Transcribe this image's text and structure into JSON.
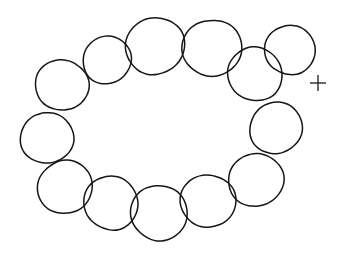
{
  "figure": {
    "background_color": "#ffffff",
    "stroke_color": "#16161a",
    "canvas": {
      "width": 346,
      "height": 272
    },
    "shape_count": 13,
    "arrangement": "closed loop / necklace",
    "stroke_width": 1.5
  },
  "chart_data": {
    "type": "scatter",
    "xlabel": "",
    "ylabel": "",
    "xlim": [
      0,
      346
    ],
    "ylim": [
      0,
      272
    ],
    "grid": false,
    "legend": "none",
    "series": [
      {
        "name": "circles",
        "marker": "open-circle",
        "points": [
          {
            "id": "circle-1",
            "label": "upper-left",
            "cx": 62,
            "cy": 85,
            "r": 26
          },
          {
            "id": "circle-2",
            "label": "left",
            "cx": 47,
            "cy": 138,
            "r": 26
          },
          {
            "id": "circle-3",
            "label": "lower-left",
            "cx": 65,
            "cy": 187,
            "r": 27
          },
          {
            "id": "circle-4",
            "label": "bottom-left",
            "cx": 111,
            "cy": 203,
            "r": 27
          },
          {
            "id": "circle-5",
            "label": "bottom-center",
            "cx": 159,
            "cy": 213,
            "r": 28
          },
          {
            "id": "circle-6",
            "label": "bottom-right",
            "cx": 208,
            "cy": 201,
            "r": 27
          },
          {
            "id": "circle-7",
            "label": "lower-right",
            "cx": 256,
            "cy": 180,
            "r": 27
          },
          {
            "id": "circle-8",
            "label": "right",
            "cx": 276,
            "cy": 128,
            "r": 26
          },
          {
            "id": "circle-9",
            "label": "upper-right",
            "cx": 255,
            "cy": 74,
            "r": 27
          },
          {
            "id": "circle-10",
            "label": "top-far-right",
            "cx": 290,
            "cy": 50,
            "r": 25
          },
          {
            "id": "circle-11",
            "label": "top-right",
            "cx": 212,
            "cy": 48,
            "r": 29
          },
          {
            "id": "circle-12",
            "label": "top-center",
            "cx": 155,
            "cy": 46,
            "r": 29
          },
          {
            "id": "circle-13",
            "label": "top-left",
            "cx": 107,
            "cy": 60,
            "r": 24
          }
        ]
      },
      {
        "name": "fixation-cross",
        "marker": "plus",
        "points": [
          {
            "id": "fixation-cross",
            "label": "+",
            "cx": 318,
            "cy": 83,
            "size": 16
          }
        ]
      }
    ],
    "annotations": [
      {
        "text": "+",
        "x": 318,
        "y": 83,
        "role": "fixation marker"
      }
    ]
  }
}
